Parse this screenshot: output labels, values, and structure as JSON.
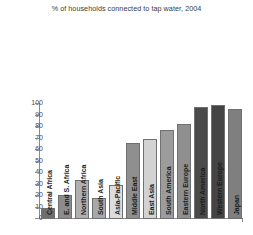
{
  "chart_data": {
    "type": "bar",
    "title": "% of households connected to tap water, 2004",
    "xlabel": "",
    "ylabel": "",
    "ylim": [
      0,
      100
    ],
    "ytick_labels": [
      "100",
      "90",
      "80",
      "70",
      "60",
      "50",
      "40",
      "30",
      "20",
      "10",
      "0"
    ],
    "yticks": [
      100,
      90,
      80,
      70,
      60,
      50,
      40,
      30,
      20,
      10,
      0
    ],
    "grid": false,
    "legend": null,
    "categories": [
      "Central Africa",
      "E. and S. Africa",
      "Northern Africa",
      "South Asia",
      "Asia-Pacific",
      "Middle East",
      "East Asia",
      "South America",
      "Eastern Europe",
      "North America",
      "Western Europe",
      "Japan"
    ],
    "values": [
      10,
      21,
      34,
      18,
      30,
      66,
      70,
      77,
      83,
      97,
      99,
      96
    ],
    "bar_colors": [
      "#6e6e6e",
      "#8c8c8c",
      "#b0b0b0",
      "#a8a8a8",
      "#dcdcdc",
      "#8f8f8f",
      "#d2d2d2",
      "#9c9c9c",
      "#8f8f8f",
      "#4a4a4a",
      "#444444",
      "#7f7f7f"
    ]
  },
  "colors": {
    "background": "#ffffff",
    "axis": "#8a8a8a",
    "title_text": "#3a3a3a",
    "tick_text": "#4a4a4a",
    "label_text": "#1c1c1c"
  }
}
